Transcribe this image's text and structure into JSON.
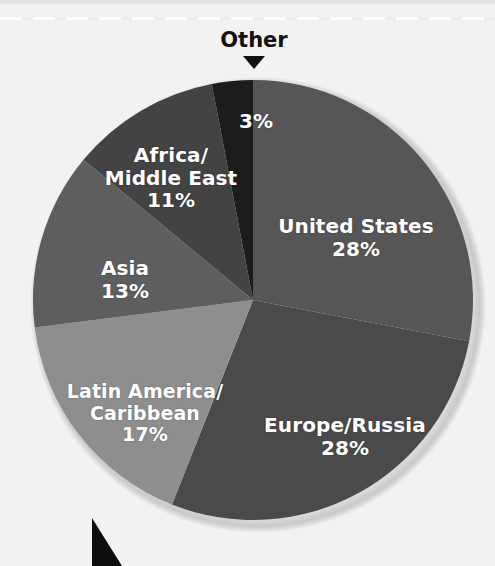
{
  "figure": {
    "background_color": "#f2f2f2",
    "callout": {
      "label": "Other",
      "pointer_icon": "triangle-down-icon",
      "color": "#111111"
    },
    "corner_marker_icon": "triangle-corner-icon"
  },
  "chart_data": {
    "type": "pie",
    "title": "",
    "subtitle": "",
    "xlabel": "",
    "ylabel": "",
    "legend_position": "none",
    "grid": false,
    "value_suffix": "%",
    "center": {
      "x": 253,
      "y": 300
    },
    "radius": 220,
    "start_angle_deg": 0,
    "direction": "clockwise",
    "categories": [
      "United States",
      "Europe/Russia",
      "Latin America/Caribbean",
      "Asia",
      "Africa/Middle East",
      "Other"
    ],
    "values": [
      28,
      28,
      17,
      13,
      11,
      3
    ],
    "slices": [
      {
        "name": "United States",
        "label": "United States",
        "value": 28,
        "value_label": "28%",
        "color": "#565656",
        "start_deg": 0,
        "end_deg": 100.8
      },
      {
        "name": "Europe/Russia",
        "label": "Europe/Russia",
        "value": 28,
        "value_label": "28%",
        "color": "#4a4a4a",
        "start_deg": 100.8,
        "end_deg": 201.6
      },
      {
        "name": "Latin America/Caribbean",
        "label": "Latin America/\nCaribbean",
        "value": 17,
        "value_label": "17%",
        "color": "#8e8e8e",
        "start_deg": 201.6,
        "end_deg": 262.8
      },
      {
        "name": "Asia",
        "label": "Asia",
        "value": 13,
        "value_label": "13%",
        "color": "#5e5e5e",
        "start_deg": 262.8,
        "end_deg": 309.6
      },
      {
        "name": "Africa/Middle East",
        "label": "Africa/\nMiddle East",
        "value": 11,
        "value_label": "11%",
        "color": "#434343",
        "start_deg": 309.6,
        "end_deg": 349.2
      },
      {
        "name": "Other",
        "label": "Other",
        "value": 3,
        "value_label": "3%",
        "color": "#1c1c1c",
        "start_deg": 349.2,
        "end_deg": 360
      }
    ]
  },
  "labels": {
    "united_states": {
      "name": "United States",
      "pct": "28%"
    },
    "europe_russia": {
      "name": "Europe/Russia",
      "pct": "28%"
    },
    "latin_america": {
      "name": "Latin America/\nCaribbean",
      "pct": "17%"
    },
    "asia": {
      "name": "Asia",
      "pct": "13%"
    },
    "africa_middle_east": {
      "name": "Africa/\nMiddle East",
      "pct": "11%"
    },
    "other": {
      "name": "Other",
      "pct": "3%"
    }
  }
}
